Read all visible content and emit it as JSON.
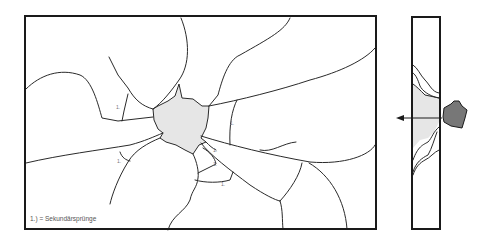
{
  "diagram": {
    "type": "glass-fracture-illustration",
    "front_view": {
      "legend_text": "1.) = Sekundärsprünge",
      "secondary_crack_marker": "1.",
      "impact_zone_color": "#e6e6e6",
      "crack_color": "#2a2a2a",
      "frame_color": "#1a1a1a"
    },
    "side_view": {
      "projectile_color": "#777777",
      "spall_zone_color": "#e6e6e6",
      "arrow": "impact-direction-arrow"
    }
  }
}
